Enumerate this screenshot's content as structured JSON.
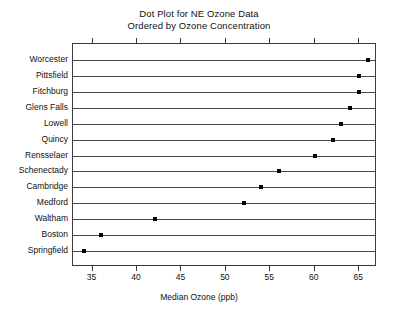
{
  "chart_data": {
    "type": "scatter",
    "title": "Dot Plot for NE Ozone Data",
    "subtitle": "Ordered by Ozone Concentration",
    "xlabel": "Median Ozone (ppb)",
    "ylabel": "",
    "orientation": "horizontal",
    "grid": false,
    "legend": "none",
    "xlim": [
      32.8,
      67
    ],
    "xticks": [
      35,
      40,
      45,
      50,
      55,
      60,
      65
    ],
    "xtick_labels": [
      "35",
      "40",
      "45",
      "50",
      "55",
      "60",
      "65"
    ],
    "categories": [
      "Worcester",
      "Pittsfield",
      "Fitchburg",
      "Glens Falls",
      "Lowell",
      "Quincy",
      "Rensselaer",
      "Schenectady",
      "Cambridge",
      "Medford",
      "Waltham",
      "Boston",
      "Springfield"
    ],
    "values": [
      66,
      65,
      65,
      64,
      63,
      62,
      60,
      56,
      54,
      52,
      42,
      36,
      34
    ],
    "points": [
      {
        "category": "Worcester",
        "value": 66
      },
      {
        "category": "Pittsfield",
        "value": 65
      },
      {
        "category": "Fitchburg",
        "value": 65
      },
      {
        "category": "Glens Falls",
        "value": 64
      },
      {
        "category": "Lowell",
        "value": 63
      },
      {
        "category": "Quincy",
        "value": 62
      },
      {
        "category": "Rensselaer",
        "value": 60
      },
      {
        "category": "Schenectady",
        "value": 56
      },
      {
        "category": "Cambridge",
        "value": 54
      },
      {
        "category": "Medford",
        "value": 52
      },
      {
        "category": "Waltham",
        "value": 42
      },
      {
        "category": "Boston",
        "value": 36
      },
      {
        "category": "Springfield",
        "value": 34
      }
    ],
    "colors": {
      "dot": "#000000",
      "line": "#4a4a4a",
      "frame": "#3a3a3a",
      "text": "#111111",
      "background": "#ffffff"
    }
  }
}
